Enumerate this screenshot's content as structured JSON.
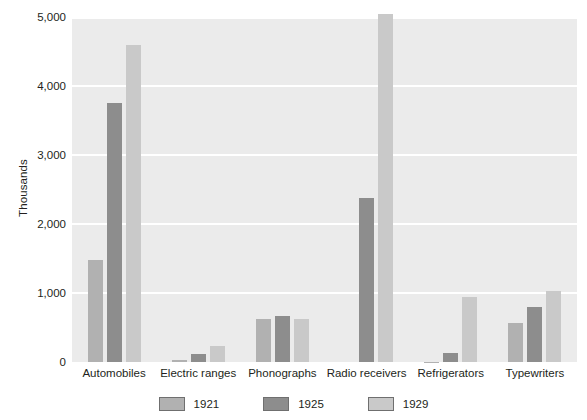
{
  "chart_data": {
    "type": "bar",
    "title": "",
    "subtitle": "",
    "xlabel": "",
    "ylabel": "Thousands",
    "ylim": [
      0,
      5000
    ],
    "ytick_labels": [
      "5,000",
      "4,000",
      "3,000",
      "2,000",
      "1,000",
      "0"
    ],
    "ytick_values": [
      5000,
      4000,
      3000,
      2000,
      1000,
      0
    ],
    "grid": true,
    "grid_color": "#ffffff",
    "plot_background": "#ebebeb",
    "legend_position": "bottom",
    "categories": [
      "Automobiles",
      "Electric ranges",
      "Phonographs",
      "Radio receivers",
      "Refrigerators",
      "Typewriters"
    ],
    "series": [
      {
        "name": "1921",
        "color": "#b1b1b1",
        "values": [
          1475,
          30,
          620,
          0,
          5,
          560
        ]
      },
      {
        "name": "1925",
        "color": "#8d8d8d",
        "values": [
          3750,
          110,
          670,
          2380,
          130,
          800
        ]
      },
      {
        "name": "1929",
        "color": "#c9c9c9",
        "values": [
          4590,
          230,
          630,
          5040,
          940,
          1030
        ]
      }
    ]
  },
  "axis": {
    "y_title": "Thousands"
  },
  "legend": {
    "entries": [
      {
        "label": "1921",
        "color": "#b1b1b1"
      },
      {
        "label": "1925",
        "color": "#8d8d8d"
      },
      {
        "label": "1929",
        "color": "#c9c9c9"
      }
    ]
  }
}
